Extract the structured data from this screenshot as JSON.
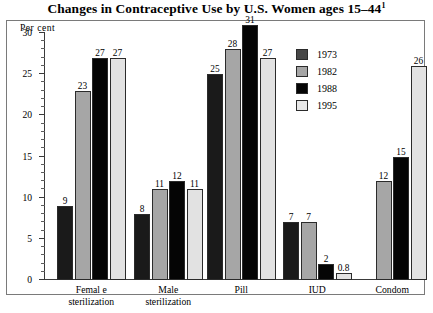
{
  "chart_data": {
    "type": "bar",
    "title": "Changes in Contraceptive Use by U.S. Women ages 15–44",
    "title_superscript": "1",
    "xlabel": "",
    "ylabel": "Per cent",
    "ylim": [
      0,
      30
    ],
    "yticks": [
      0,
      5,
      10,
      15,
      20,
      25,
      30
    ],
    "ytick_labels": [
      "0",
      "5",
      "10",
      "15",
      "20",
      "25",
      "30"
    ],
    "minor_tick_step": 1,
    "grid": false,
    "legend_position": "upper right",
    "categories": [
      "Female sterilization",
      "Male sterilization",
      "Pill",
      "IUD",
      "Condom"
    ],
    "category_lines": [
      [
        "Femal e",
        "sterilization"
      ],
      [
        "Male",
        "sterilization"
      ],
      [
        "Pill"
      ],
      [
        "IUD"
      ],
      [
        "Condom"
      ]
    ],
    "series": [
      {
        "name": "1973",
        "color": "#1a1a1a",
        "values": [
          9,
          8,
          25,
          7,
          null
        ],
        "labels": [
          "9",
          "8",
          "25",
          "7",
          ""
        ]
      },
      {
        "name": "1982",
        "color": "#a6a6a6",
        "values": [
          23,
          11,
          28,
          7,
          12
        ],
        "labels": [
          "23",
          "11",
          "28",
          "7",
          "12"
        ]
      },
      {
        "name": "1988",
        "color": "#050505",
        "values": [
          27,
          12,
          31,
          2,
          15
        ],
        "labels": [
          "27",
          "12",
          "31",
          "2",
          "15"
        ]
      },
      {
        "name": "1995",
        "color": "#e2e2e2",
        "values": [
          27,
          11,
          27,
          0.8,
          26
        ],
        "labels": [
          "27",
          "11",
          "27",
          "0.8",
          "26"
        ]
      }
    ],
    "legend_entries": [
      {
        "label": "1973",
        "color": "#474747"
      },
      {
        "label": "1982",
        "color": "#a6a6a6"
      },
      {
        "label": "1988",
        "color": "#050505"
      },
      {
        "label": "1995",
        "color": "#e8e8e8"
      }
    ]
  }
}
